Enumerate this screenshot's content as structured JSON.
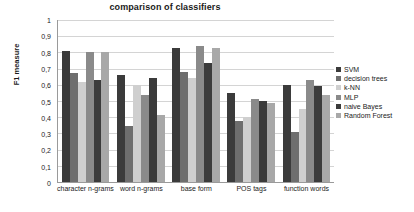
{
  "chart_data": {
    "type": "bar",
    "title": "comparison of classifiers",
    "xlabel": "",
    "ylabel": "F1 measure",
    "ylim": [
      0,
      1
    ],
    "ytick_labels": [
      "1",
      "0,9",
      "0,8",
      "0,7",
      "0,6",
      "0,5",
      "0,4",
      "0,3",
      "0,2",
      "0,1",
      "0"
    ],
    "ytick_values": [
      1,
      0.9,
      0.8,
      0.7,
      0.6,
      0.5,
      0.4,
      0.3,
      0.2,
      0.1,
      0
    ],
    "grid": true,
    "legend_position": "right",
    "categories": [
      "character n-grams",
      "word n-grams",
      "base form",
      "POS tags",
      "function words"
    ],
    "series": [
      {
        "name": "SVM",
        "color": "#3b3b3b",
        "values": [
          0.81,
          0.66,
          0.83,
          0.55,
          0.6
        ]
      },
      {
        "name": "decision trees",
        "color": "#6e6e6e",
        "values": [
          0.675,
          0.345,
          0.68,
          0.375,
          0.31
        ]
      },
      {
        "name": "k-NN",
        "color": "#cfcfcf",
        "values": [
          0.615,
          0.598,
          0.645,
          0.4,
          0.45
        ]
      },
      {
        "name": "MLP",
        "color": "#8a8a8a",
        "values": [
          0.805,
          0.535,
          0.84,
          0.515,
          0.63
        ]
      },
      {
        "name": "naive Bayes",
        "color": "#3b3b3b",
        "values": [
          0.63,
          0.64,
          0.737,
          0.502,
          0.59
        ]
      },
      {
        "name": "Random Forest",
        "color": "#a8a8a8",
        "values": [
          0.8,
          0.415,
          0.825,
          0.487,
          0.54
        ]
      }
    ]
  }
}
